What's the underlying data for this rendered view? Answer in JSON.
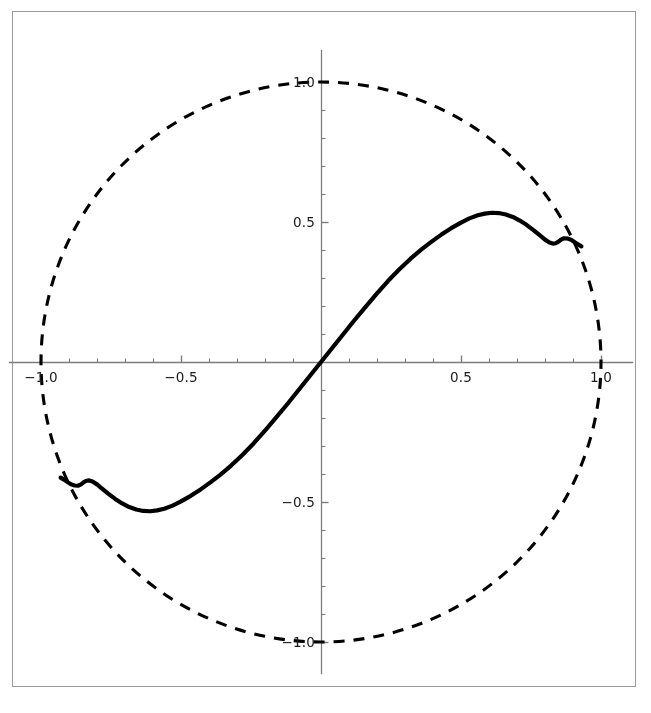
{
  "figure": {
    "width": 651,
    "height": 713,
    "background_color": "#ffffff",
    "frame_color": "#9a9a9a",
    "title": "",
    "subtitle": ""
  },
  "chart_data": {
    "type": "line",
    "title": "",
    "subtitle": "",
    "xlabel": "",
    "ylabel": "",
    "xlim": [
      -1.12,
      1.12
    ],
    "ylim": [
      -1.12,
      1.12
    ],
    "grid": false,
    "legend": null,
    "aspect": "equal",
    "axes": {
      "x_tick_labels": [
        "-1.0",
        "-0.5",
        "0.5",
        "1.0"
      ],
      "x_tick_values": [
        -1.0,
        -0.5,
        0.5,
        1.0
      ],
      "y_tick_labels": [
        "1.0",
        "0.5",
        "-0.5",
        "-1.0"
      ],
      "y_tick_values": [
        1.0,
        0.5,
        -0.5,
        -1.0
      ],
      "minor_tick_step": 0.1,
      "axis_color": "#7d7d7d",
      "tick_label_color": "#1a1a1a",
      "origin_label_shown": false
    },
    "series": [
      {
        "name": "unit-circle",
        "style": "dashed",
        "color": "#000000",
        "line_width": 3.1,
        "dash_pattern": [
          11,
          9
        ],
        "description": "Dashed reference circle of radius 1.0 centered at the origin",
        "radius": 1.0
      },
      {
        "name": "response-curve",
        "style": "solid",
        "color": "#000000",
        "line_width": 4.2,
        "description": "Thick solid odd-symmetric curve from the lower-left circle boundary through the origin to the upper-right circle boundary, with a maximum near (0.61, 0.53) and small ripples near the endpoints",
        "points": [
          [
            -0.93,
            -0.413
          ],
          [
            -0.918,
            -0.42
          ],
          [
            -0.905,
            -0.429
          ],
          [
            -0.893,
            -0.437
          ],
          [
            -0.88,
            -0.441
          ],
          [
            -0.868,
            -0.442
          ],
          [
            -0.857,
            -0.437
          ],
          [
            -0.847,
            -0.429
          ],
          [
            -0.838,
            -0.424
          ],
          [
            -0.828,
            -0.423
          ],
          [
            -0.816,
            -0.427
          ],
          [
            -0.8,
            -0.437
          ],
          [
            -0.782,
            -0.452
          ],
          [
            -0.76,
            -0.47
          ],
          [
            -0.735,
            -0.489
          ],
          [
            -0.71,
            -0.505
          ],
          [
            -0.685,
            -0.518
          ],
          [
            -0.66,
            -0.527
          ],
          [
            -0.635,
            -0.532
          ],
          [
            -0.61,
            -0.533
          ],
          [
            -0.585,
            -0.53
          ],
          [
            -0.56,
            -0.524
          ],
          [
            -0.53,
            -0.513
          ],
          [
            -0.5,
            -0.498
          ],
          [
            -0.465,
            -0.478
          ],
          [
            -0.43,
            -0.455
          ],
          [
            -0.395,
            -0.43
          ],
          [
            -0.36,
            -0.403
          ],
          [
            -0.32,
            -0.369
          ],
          [
            -0.28,
            -0.331
          ],
          [
            -0.24,
            -0.29
          ],
          [
            -0.2,
            -0.245
          ],
          [
            -0.16,
            -0.198
          ],
          [
            -0.12,
            -0.15
          ],
          [
            -0.08,
            -0.1
          ],
          [
            -0.04,
            -0.05
          ],
          [
            0.0,
            0.0
          ],
          [
            0.04,
            0.05
          ],
          [
            0.08,
            0.1
          ],
          [
            0.12,
            0.15
          ],
          [
            0.16,
            0.198
          ],
          [
            0.2,
            0.245
          ],
          [
            0.24,
            0.29
          ],
          [
            0.28,
            0.331
          ],
          [
            0.32,
            0.369
          ],
          [
            0.36,
            0.403
          ],
          [
            0.395,
            0.43
          ],
          [
            0.43,
            0.455
          ],
          [
            0.465,
            0.478
          ],
          [
            0.5,
            0.498
          ],
          [
            0.53,
            0.513
          ],
          [
            0.56,
            0.524
          ],
          [
            0.585,
            0.53
          ],
          [
            0.61,
            0.533
          ],
          [
            0.635,
            0.532
          ],
          [
            0.66,
            0.527
          ],
          [
            0.685,
            0.518
          ],
          [
            0.71,
            0.505
          ],
          [
            0.735,
            0.489
          ],
          [
            0.76,
            0.47
          ],
          [
            0.782,
            0.452
          ],
          [
            0.8,
            0.437
          ],
          [
            0.816,
            0.427
          ],
          [
            0.828,
            0.423
          ],
          [
            0.838,
            0.424
          ],
          [
            0.847,
            0.429
          ],
          [
            0.857,
            0.437
          ],
          [
            0.868,
            0.442
          ],
          [
            0.88,
            0.441
          ],
          [
            0.893,
            0.437
          ],
          [
            0.905,
            0.429
          ],
          [
            0.918,
            0.42
          ],
          [
            0.93,
            0.413
          ]
        ]
      }
    ],
    "annotations": []
  }
}
